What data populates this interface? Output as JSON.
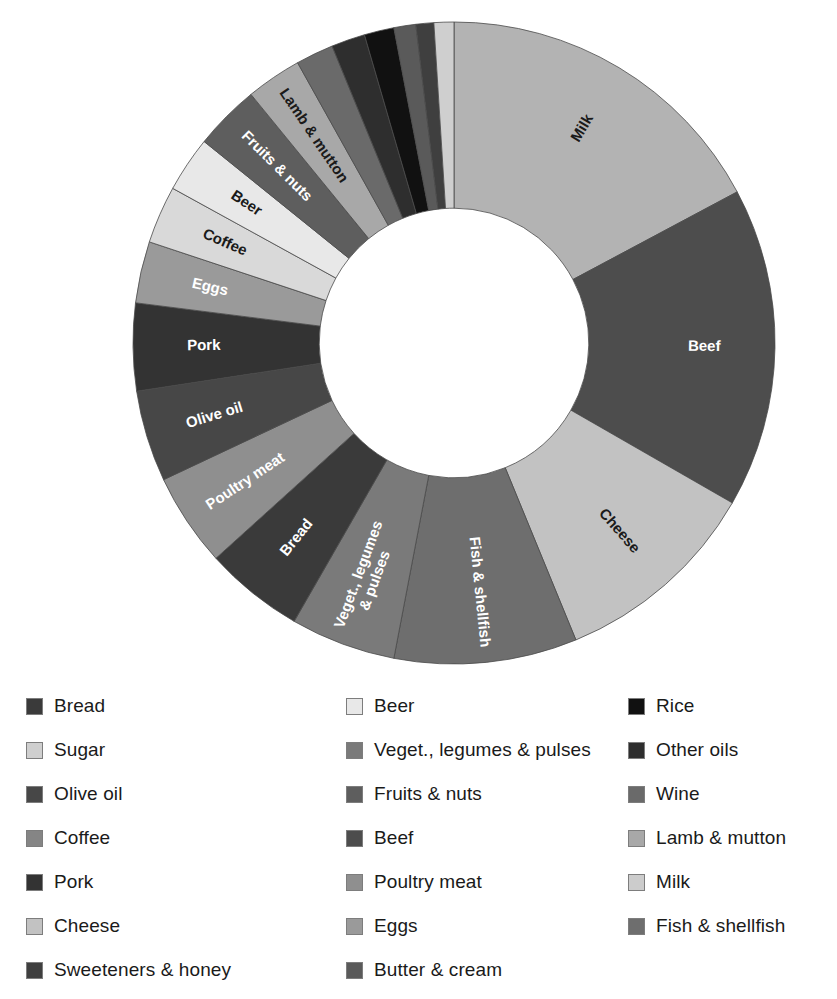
{
  "chart_data": {
    "type": "pie",
    "variant": "donut",
    "title": "",
    "xlabel": "",
    "ylabel": "",
    "legend_position": "bottom",
    "grid": false,
    "start_angle_deg": 0,
    "direction": "clockwise",
    "inner_radius_ratio": 0.42,
    "categories": [
      "Milk",
      "Beef",
      "Cheese",
      "Fish & shellfish",
      "Veget., legumes & pulses",
      "Bread",
      "Poultry meat",
      "Olive oil",
      "Pork",
      "Eggs",
      "Coffee",
      "Beer",
      "Fruits & nuts",
      "Lamb & mutton",
      "Wine",
      "Other oils",
      "Rice",
      "Butter & cream",
      "Sweeteners & honey",
      "Sugar"
    ],
    "values": [
      17.2,
      16.1,
      10.5,
      9.2,
      5.3,
      5.0,
      4.7,
      4.6,
      4.4,
      3.1,
      2.9,
      2.8,
      3.3,
      2.8,
      1.9,
      1.7,
      1.5,
      1.1,
      0.9,
      1.0
    ],
    "colors": [
      "#b3b3b3",
      "#4d4d4d",
      "#c2c2c2",
      "#6e6e6e",
      "#7a7a7a",
      "#3a3a3a",
      "#8f8f8f",
      "#474747",
      "#333333",
      "#9a9a9a",
      "#d9d9d9",
      "#e8e8e8",
      "#5e5e5e",
      "#a8a8a8",
      "#6a6a6a",
      "#2e2e2e",
      "#111111",
      "#5a5a5a",
      "#3f3f3f",
      "#cfcfcf"
    ],
    "labeled_slices": [
      {
        "name": "Milk",
        "label_color": "#1a1a1a"
      },
      {
        "name": "Beef",
        "label_color": "#ffffff"
      },
      {
        "name": "Cheese",
        "label_color": "#1a1a1a"
      },
      {
        "name": "Fish & shellfish",
        "label_color": "#ffffff"
      },
      {
        "name": "Veget., legumes & pulses",
        "label_color": "#ffffff"
      },
      {
        "name": "Bread",
        "label_color": "#ffffff"
      },
      {
        "name": "Poultry meat",
        "label_color": "#ffffff"
      },
      {
        "name": "Olive oil",
        "label_color": "#ffffff"
      },
      {
        "name": "Pork",
        "label_color": "#ffffff"
      },
      {
        "name": "Eggs",
        "label_color": "#ffffff"
      },
      {
        "name": "Coffee",
        "label_color": "#1a1a1a"
      },
      {
        "name": "Beer",
        "label_color": "#1a1a1a"
      },
      {
        "name": "Fruits & nuts",
        "label_color": "#ffffff"
      },
      {
        "name": "Lamb & mutton",
        "label_color": "#1a1a1a"
      }
    ]
  },
  "legend": {
    "columns": [
      [
        {
          "label": "Bread",
          "color": "#3a3a3a"
        },
        {
          "label": "Sugar",
          "color": "#cfcfcf"
        },
        {
          "label": "Olive oil",
          "color": "#474747"
        },
        {
          "label": "Coffee",
          "color": "#858585"
        },
        {
          "label": "Pork",
          "color": "#333333"
        },
        {
          "label": "Cheese",
          "color": "#c2c2c2"
        },
        {
          "label": "Sweeteners & honey",
          "color": "#3f3f3f"
        }
      ],
      [
        {
          "label": "Beer",
          "color": "#e8e8e8"
        },
        {
          "label": "Veget., legumes & pulses",
          "color": "#7a7a7a"
        },
        {
          "label": "Fruits & nuts",
          "color": "#5e5e5e"
        },
        {
          "label": "Beef",
          "color": "#4d4d4d"
        },
        {
          "label": "Poultry meat",
          "color": "#8f8f8f"
        },
        {
          "label": "Eggs",
          "color": "#9a9a9a"
        },
        {
          "label": "Butter & cream",
          "color": "#5a5a5a"
        }
      ],
      [
        {
          "label": "Rice",
          "color": "#111111"
        },
        {
          "label": "Other oils",
          "color": "#2e2e2e"
        },
        {
          "label": "Wine",
          "color": "#6a6a6a"
        },
        {
          "label": "Lamb & mutton",
          "color": "#a8a8a8"
        },
        {
          "label": "Milk",
          "color": "#cccccc"
        },
        {
          "label": "Fish & shellfish",
          "color": "#6e6e6e"
        }
      ]
    ]
  }
}
